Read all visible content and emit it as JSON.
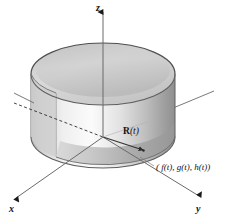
{
  "figure": {
    "background_color": "#ffffff",
    "width": 234,
    "height": 216
  },
  "axes": {
    "z": {
      "label": "z",
      "name": "z-axis",
      "arrow": "up"
    },
    "x": {
      "label": "x",
      "name": "x-axis",
      "arrow": "down-left"
    },
    "y": {
      "label": "y",
      "name": "y-axis",
      "arrow": "down-right"
    },
    "line_color": "#5a5a5a",
    "dashed_segment": "negative-x-hidden-behind-surface"
  },
  "labels": {
    "vector_prefix": "R",
    "vector_suffix": "(t)",
    "point": "( f(t), g(t), h(t))"
  },
  "surface": {
    "kind": "open-cylinder",
    "top_face_color": "#d4d4d4",
    "wall_light_color": "#f0f0f0",
    "wall_mid_color": "#c6c6c6",
    "wall_dark_color": "#9a9a9a",
    "outline_color": "#4a4a4a",
    "inner_shadow_color": "#b5b5b5"
  },
  "geometry": {
    "origin": {
      "x": 103,
      "y": 137
    },
    "top_ellipse_center": {
      "x": 103,
      "y": 74
    },
    "bottom_ellipse_center": {
      "x": 103,
      "y": 137
    },
    "ellipse_rx": 72,
    "ellipse_ry": 31,
    "cylinder_height": 63,
    "point_on_curve": {
      "x": 147,
      "y": 153
    },
    "vector_tip": {
      "x": 141,
      "y": 149
    }
  }
}
